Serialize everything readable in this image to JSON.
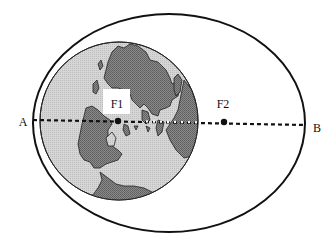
{
  "diagram": {
    "labels": {
      "apogee_end": "A",
      "perigee_end": "B",
      "focus1": "F1",
      "focus2": "F2"
    },
    "colors": {
      "background": "#ffffff",
      "stroke": "#111111",
      "ocean": "#d4d4d4",
      "land": "#7a7a7a",
      "label_box": "#ffffff"
    },
    "geometry": {
      "orbit_ellipse": {
        "cx": 169,
        "cy": 123,
        "rx": 136,
        "ry": 109
      },
      "earth": {
        "cx": 119,
        "cy": 121,
        "r": 79
      },
      "major_axis": {
        "x1": 33,
        "y1": 120,
        "x2": 305,
        "y2": 125
      },
      "focus1_point": {
        "x": 118,
        "y": 121
      },
      "focus2_point": {
        "x": 224,
        "y": 122
      }
    }
  }
}
